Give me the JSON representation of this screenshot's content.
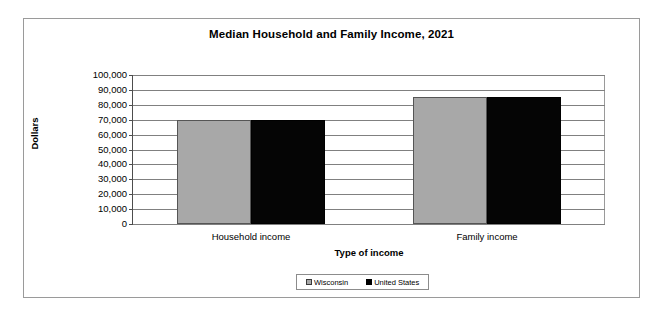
{
  "chart_data": {
    "type": "bar",
    "title": "Median Household and Family Income, 2021",
    "xlabel": "Type of income",
    "ylabel": "Dollars",
    "categories": [
      "Household income",
      "Family income"
    ],
    "series": [
      {
        "name": "Wisconsin",
        "color": "#a8a8a8",
        "values": [
          69500,
          85500
        ]
      },
      {
        "name": "United States",
        "color": "#000000",
        "values": [
          69500,
          85500
        ]
      }
    ],
    "ylim": [
      0,
      100000
    ],
    "ytick_labels": [
      "100,000",
      "90,000",
      "80,000",
      "70,000",
      "60,000",
      "50,000",
      "40,000",
      "30,000",
      "20,000",
      "10,000",
      "0"
    ],
    "ytick_values": [
      100000,
      90000,
      80000,
      70000,
      60000,
      50000,
      40000,
      30000,
      20000,
      10000,
      0
    ],
    "grid": true,
    "legend_position": "bottom"
  },
  "legend": {
    "entries": [
      {
        "label": "Wisconsin"
      },
      {
        "label": "United States"
      }
    ]
  }
}
